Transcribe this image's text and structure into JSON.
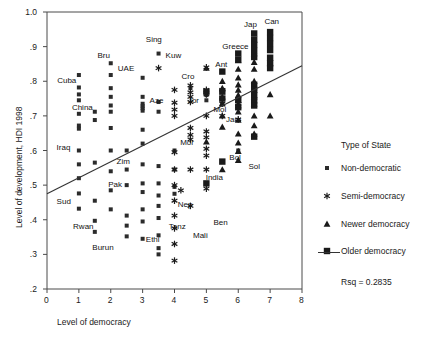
{
  "chart_data": {
    "type": "scatter",
    "title": "",
    "xlabel": "Level of democracy",
    "ylabel": "Level of development, HDI 1998",
    "xlim": [
      0,
      8
    ],
    "ylim": [
      0.2,
      1.0
    ],
    "xticks": [
      "0",
      "1",
      "2",
      "3",
      "4",
      "5",
      "6",
      "7",
      "8"
    ],
    "xtick_values": [
      0,
      1,
      2,
      3,
      4,
      5,
      6,
      7,
      8
    ],
    "yticks": [
      ".2",
      ".3",
      ".4",
      ".5",
      ".6",
      ".7",
      ".8",
      ".9",
      "1.0"
    ],
    "ytick_values": [
      0.2,
      0.3,
      0.4,
      0.5,
      0.6,
      0.7,
      0.8,
      0.9,
      1.0
    ],
    "grid": false,
    "legend_position": "right",
    "regression": {
      "label": "Rsq = 0.2835",
      "rsq": 0.2835,
      "x_start": 0.0,
      "y_start": 0.475,
      "x_end": 8.0,
      "y_end": 0.845
    },
    "legend_heading": "Type of State",
    "series": [
      {
        "name": "Non-democratic",
        "marker": "small-square",
        "values": [
          [
            1.0,
            0.818
          ],
          [
            1.0,
            0.782
          ],
          [
            1.0,
            0.762
          ],
          [
            1.0,
            0.745
          ],
          [
            1.0,
            0.706
          ],
          [
            1.0,
            0.672
          ],
          [
            1.0,
            0.663
          ],
          [
            1.0,
            0.6
          ],
          [
            1.0,
            0.56
          ],
          [
            1.0,
            0.52
          ],
          [
            1.0,
            0.476
          ],
          [
            1.0,
            0.432
          ],
          [
            1.5,
            0.712
          ],
          [
            1.5,
            0.688
          ],
          [
            1.5,
            0.565
          ],
          [
            1.5,
            0.455
          ],
          [
            1.5,
            0.397
          ],
          [
            1.5,
            0.365
          ],
          [
            2.0,
            0.852
          ],
          [
            2.0,
            0.818
          ],
          [
            2.0,
            0.78
          ],
          [
            2.0,
            0.755
          ],
          [
            2.0,
            0.73
          ],
          [
            2.0,
            0.712
          ],
          [
            2.0,
            0.665
          ],
          [
            2.0,
            0.6
          ],
          [
            2.0,
            0.54
          ],
          [
            2.0,
            0.485
          ],
          [
            2.0,
            0.43
          ],
          [
            2.5,
            0.6
          ],
          [
            2.5,
            0.545
          ],
          [
            2.5,
            0.5
          ],
          [
            2.5,
            0.412
          ],
          [
            2.5,
            0.383
          ],
          [
            2.5,
            0.352
          ],
          [
            3.0,
            0.81
          ],
          [
            3.0,
            0.755
          ],
          [
            3.0,
            0.735
          ],
          [
            3.0,
            0.728
          ],
          [
            3.0,
            0.722
          ],
          [
            3.0,
            0.715
          ],
          [
            3.0,
            0.66
          ],
          [
            3.0,
            0.62
          ],
          [
            3.0,
            0.56
          ],
          [
            3.0,
            0.505
          ],
          [
            3.0,
            0.48
          ],
          [
            3.0,
            0.43
          ],
          [
            3.0,
            0.395
          ],
          [
            3.0,
            0.345
          ],
          [
            3.5,
            0.88
          ],
          [
            3.5,
            0.74
          ],
          [
            3.5,
            0.712
          ],
          [
            3.5,
            0.555
          ],
          [
            3.5,
            0.505
          ],
          [
            3.5,
            0.47
          ],
          [
            3.5,
            0.44
          ],
          [
            3.5,
            0.405
          ],
          [
            3.5,
            0.355
          ],
          [
            3.5,
            0.318
          ],
          [
            3.5,
            0.3
          ],
          [
            4.0,
            0.6
          ],
          [
            4.0,
            0.545
          ],
          [
            4.0,
            0.495
          ],
          [
            4.0,
            0.475
          ],
          [
            4.5,
            0.78
          ],
          [
            5.0,
            0.76
          ],
          [
            5.0,
            0.745
          ],
          [
            5.5,
            0.735
          ],
          [
            6.0,
            0.6
          ]
        ]
      },
      {
        "name": "Semi-democracy",
        "marker": "asterisk",
        "values": [
          [
            3.5,
            0.838
          ],
          [
            4.0,
            0.775
          ],
          [
            4.0,
            0.738
          ],
          [
            4.0,
            0.718
          ],
          [
            4.0,
            0.7
          ],
          [
            4.0,
            0.595
          ],
          [
            4.0,
            0.545
          ],
          [
            4.0,
            0.5
          ],
          [
            4.0,
            0.455
          ],
          [
            4.0,
            0.412
          ],
          [
            4.0,
            0.375
          ],
          [
            4.0,
            0.33
          ],
          [
            4.0,
            0.282
          ],
          [
            4.5,
            0.788
          ],
          [
            4.5,
            0.768
          ],
          [
            4.5,
            0.755
          ],
          [
            4.5,
            0.74
          ],
          [
            4.5,
            0.665
          ],
          [
            4.5,
            0.645
          ],
          [
            4.5,
            0.632
          ],
          [
            4.5,
            0.545
          ],
          [
            4.5,
            0.44
          ],
          [
            5.0,
            0.84
          ],
          [
            5.0,
            0.775
          ],
          [
            5.0,
            0.762
          ],
          [
            5.0,
            0.7
          ],
          [
            5.0,
            0.655
          ],
          [
            5.0,
            0.638
          ],
          [
            5.0,
            0.605
          ],
          [
            5.0,
            0.585
          ],
          [
            5.0,
            0.545
          ],
          [
            5.0,
            0.49
          ],
          [
            5.5,
            0.775
          ],
          [
            5.5,
            0.735
          ],
          [
            5.5,
            0.7
          ],
          [
            6.0,
            0.735
          ],
          [
            6.0,
            0.69
          ],
          [
            4.2,
            0.485
          ]
        ]
      },
      {
        "name": "Newer democracy",
        "marker": "triangle",
        "values": [
          [
            5.0,
            0.838
          ],
          [
            5.5,
            0.8
          ],
          [
            5.5,
            0.78
          ],
          [
            5.5,
            0.755
          ],
          [
            5.5,
            0.735
          ],
          [
            5.5,
            0.7
          ],
          [
            5.5,
            0.668
          ],
          [
            6.0,
            0.86
          ],
          [
            6.0,
            0.835
          ],
          [
            6.0,
            0.81
          ],
          [
            6.0,
            0.79
          ],
          [
            6.0,
            0.775
          ],
          [
            6.0,
            0.76
          ],
          [
            6.0,
            0.745
          ],
          [
            6.0,
            0.73
          ],
          [
            6.0,
            0.712
          ],
          [
            6.0,
            0.688
          ],
          [
            6.0,
            0.648
          ],
          [
            6.0,
            0.622
          ],
          [
            6.0,
            0.598
          ],
          [
            6.0,
            0.572
          ],
          [
            6.5,
            0.88
          ],
          [
            6.5,
            0.855
          ],
          [
            6.5,
            0.835
          ],
          [
            6.5,
            0.8
          ],
          [
            6.5,
            0.782
          ],
          [
            6.5,
            0.755
          ],
          [
            6.5,
            0.735
          ],
          [
            6.5,
            0.7
          ],
          [
            6.5,
            0.672
          ],
          [
            6.5,
            0.648
          ],
          [
            7.0,
            0.762
          ],
          [
            7.0,
            0.7
          ],
          [
            5.0,
            0.625
          ],
          [
            5.5,
            0.545
          ]
        ]
      },
      {
        "name": "Older democracy",
        "marker": "large-square",
        "values": [
          [
            6.5,
            0.938
          ],
          [
            6.5,
            0.92
          ],
          [
            6.5,
            0.905
          ],
          [
            6.5,
            0.888
          ],
          [
            6.5,
            0.87
          ],
          [
            6.5,
            0.79
          ],
          [
            6.5,
            0.775
          ],
          [
            6.5,
            0.76
          ],
          [
            6.5,
            0.745
          ],
          [
            6.5,
            0.73
          ],
          [
            7.0,
            0.942
          ],
          [
            7.0,
            0.925
          ],
          [
            7.0,
            0.908
          ],
          [
            7.0,
            0.89
          ],
          [
            7.0,
            0.868
          ],
          [
            7.0,
            0.852
          ],
          [
            7.0,
            0.838
          ],
          [
            6.0,
            0.88
          ],
          [
            6.0,
            0.862
          ],
          [
            5.5,
            0.828
          ],
          [
            5.5,
            0.77
          ],
          [
            5.5,
            0.75
          ],
          [
            5.0,
            0.77
          ],
          [
            6.0,
            0.745
          ],
          [
            6.0,
            0.725
          ],
          [
            6.5,
            0.64
          ],
          [
            5.5,
            0.568
          ],
          [
            5.0,
            0.505
          ]
        ]
      }
    ],
    "point_labels": [
      {
        "text": "Cuba",
        "x": 0.32,
        "y": 0.802
      },
      {
        "text": "China",
        "x": 0.78,
        "y": 0.722
      },
      {
        "text": "Iraq",
        "x": 0.3,
        "y": 0.608
      },
      {
        "text": "Sud",
        "x": 0.3,
        "y": 0.452
      },
      {
        "text": "Rwan",
        "x": 0.82,
        "y": 0.378
      },
      {
        "text": "Burun",
        "x": 1.42,
        "y": 0.318
      },
      {
        "text": "Bru",
        "x": 1.58,
        "y": 0.872
      },
      {
        "text": "UAE",
        "x": 2.22,
        "y": 0.836
      },
      {
        "text": "Aze",
        "x": 3.22,
        "y": 0.742
      },
      {
        "text": "Pak",
        "x": 1.92,
        "y": 0.5
      },
      {
        "text": "Zim",
        "x": 2.18,
        "y": 0.568
      },
      {
        "text": "Ethi",
        "x": 3.1,
        "y": 0.342
      },
      {
        "text": "Sing",
        "x": 3.1,
        "y": 0.92
      },
      {
        "text": "Kuw",
        "x": 3.72,
        "y": 0.872
      },
      {
        "text": "Cro",
        "x": 4.22,
        "y": 0.812
      },
      {
        "text": "Jor",
        "x": 4.42,
        "y": 0.742
      },
      {
        "text": "Mor",
        "x": 4.18,
        "y": 0.622
      },
      {
        "text": "Nep",
        "x": 4.1,
        "y": 0.442
      },
      {
        "text": "Tanz",
        "x": 3.82,
        "y": 0.378
      },
      {
        "text": "Mali",
        "x": 4.58,
        "y": 0.352
      },
      {
        "text": "Ben",
        "x": 5.22,
        "y": 0.39
      },
      {
        "text": "Ant",
        "x": 5.28,
        "y": 0.848
      },
      {
        "text": "Mol",
        "x": 5.22,
        "y": 0.718
      },
      {
        "text": "Jam",
        "x": 5.62,
        "y": 0.688
      },
      {
        "text": "India",
        "x": 4.98,
        "y": 0.52
      },
      {
        "text": "Bol",
        "x": 5.72,
        "y": 0.578
      },
      {
        "text": "Sol",
        "x": 6.32,
        "y": 0.552
      },
      {
        "text": "Greece",
        "x": 5.5,
        "y": 0.898
      },
      {
        "text": "Jap",
        "x": 6.18,
        "y": 0.962
      },
      {
        "text": "Can",
        "x": 6.82,
        "y": 0.972
      }
    ]
  },
  "legend": {
    "heading": "Type of State",
    "items": [
      {
        "label": "Non-democratic",
        "marker": "small-square"
      },
      {
        "label": "Semi-democracy",
        "marker": "asterisk"
      },
      {
        "label": "Newer democracy",
        "marker": "triangle"
      },
      {
        "label": "Older democracy",
        "marker": "large-square"
      }
    ],
    "rsq_label": "Rsq = 0.2835"
  }
}
